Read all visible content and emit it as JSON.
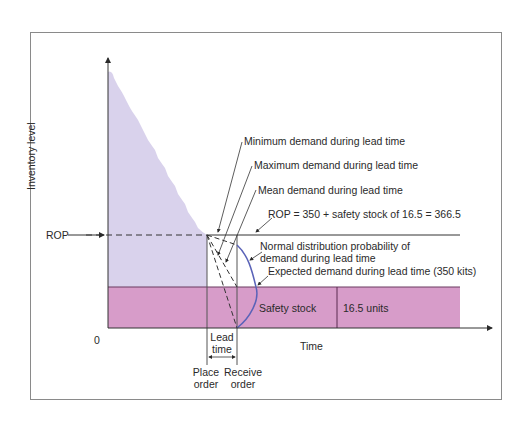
{
  "axes": {
    "y_label": "Inventory level",
    "x_label": "Time",
    "origin": "0",
    "rop_label": "ROP"
  },
  "annotations": {
    "min_demand": "Minimum demand during lead time",
    "max_demand": "Maximum demand during lead time",
    "mean_demand": "Mean demand during lead time",
    "rop_formula": "ROP = 350 + safety stock of 16.5 = 366.5",
    "normal_dist_line1": "Normal distribution probability of",
    "normal_dist_line2": "demand during lead time",
    "expected_demand": "Expected demand during lead time (350 kits)",
    "safety_stock": "Safety stock",
    "safety_units": "16.5 units",
    "lead_time_line1": "Lead",
    "lead_time_line2": "time",
    "place_order_line1": "Place",
    "place_order_line2": "order",
    "receive_order_line1": "Receive",
    "receive_order_line2": "order"
  },
  "colors": {
    "inventory_fill": "#d9d2ec",
    "safety_fill": "#d79cc9",
    "distribution_curve": "#5a63b8",
    "lines": "#3a3a3a"
  },
  "values": {
    "rop": 366.5,
    "expected_demand": 350,
    "safety_stock": 16.5
  }
}
